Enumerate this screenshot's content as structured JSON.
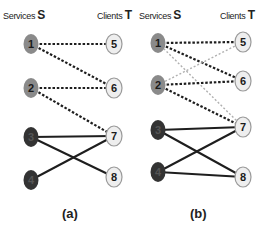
{
  "panels": [
    {
      "id": "a",
      "caption": "(a)",
      "left_header": {
        "label": "Services",
        "symbol": "S"
      },
      "right_header": {
        "label": "Clients",
        "symbol": "T"
      },
      "services": [
        {
          "id": "1",
          "x": 31,
          "y": 44,
          "shade": "medium"
        },
        {
          "id": "2",
          "x": 31,
          "y": 88,
          "shade": "medium"
        },
        {
          "id": "3",
          "x": 31,
          "y": 137,
          "shade": "dark"
        },
        {
          "id": "4",
          "x": 31,
          "y": 180,
          "shade": "dark"
        }
      ],
      "clients": [
        {
          "id": "5",
          "x": 114,
          "y": 44
        },
        {
          "id": "6",
          "x": 114,
          "y": 88
        },
        {
          "id": "7",
          "x": 114,
          "y": 136
        },
        {
          "id": "8",
          "x": 114,
          "y": 177
        }
      ],
      "edges": [
        {
          "from": "1",
          "to": "5",
          "style": "dashed"
        },
        {
          "from": "1",
          "to": "6",
          "style": "dashed"
        },
        {
          "from": "2",
          "to": "6",
          "style": "dashed"
        },
        {
          "from": "2",
          "to": "7",
          "style": "dashed"
        },
        {
          "from": "3",
          "to": "7",
          "style": "solid"
        },
        {
          "from": "3",
          "to": "8",
          "style": "solid"
        },
        {
          "from": "4",
          "to": "7",
          "style": "solid"
        }
      ]
    },
    {
      "id": "b",
      "caption": "(b)",
      "left_header": {
        "label": "Services",
        "symbol": "S"
      },
      "right_header": {
        "label": "Clients",
        "symbol": "T"
      },
      "services": [
        {
          "id": "1",
          "x": 158,
          "y": 43,
          "shade": "medium"
        },
        {
          "id": "2",
          "x": 158,
          "y": 85,
          "shade": "medium"
        },
        {
          "id": "3",
          "x": 158,
          "y": 130,
          "shade": "dark"
        },
        {
          "id": "4",
          "x": 158,
          "y": 172,
          "shade": "dark"
        }
      ],
      "clients": [
        {
          "id": "5",
          "x": 243,
          "y": 42
        },
        {
          "id": "6",
          "x": 243,
          "y": 81
        },
        {
          "id": "7",
          "x": 243,
          "y": 127
        },
        {
          "id": "8",
          "x": 243,
          "y": 177
        }
      ],
      "edges": [
        {
          "from": "1",
          "to": "5",
          "style": "dashed"
        },
        {
          "from": "1",
          "to": "6",
          "style": "dashed"
        },
        {
          "from": "1",
          "to": "7",
          "style": "light-dashed"
        },
        {
          "from": "2",
          "to": "5",
          "style": "light-dashed"
        },
        {
          "from": "2",
          "to": "6",
          "style": "dashed"
        },
        {
          "from": "2",
          "to": "7",
          "style": "dashed"
        },
        {
          "from": "3",
          "to": "7",
          "style": "solid"
        },
        {
          "from": "3",
          "to": "8",
          "style": "solid"
        },
        {
          "from": "4",
          "to": "7",
          "style": "solid"
        },
        {
          "from": "4",
          "to": "8",
          "style": "solid"
        }
      ]
    }
  ],
  "colors": {
    "service_medium": "#8a8a8a",
    "service_dark": "#333333",
    "client_fill": "#eeeeee",
    "client_stroke": "#9a9a9a",
    "edge_dark": "#1e1e1e",
    "edge_light": "#b0b0b0"
  }
}
